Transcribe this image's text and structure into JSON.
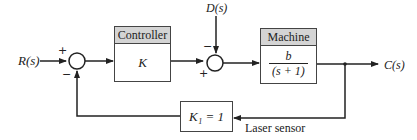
{
  "diagram": {
    "input_label": "R(s)",
    "disturbance_label": "D(s)",
    "output_label": "C(s)",
    "summing_junction_1": {
      "plus_sign": "+",
      "minus_sign": "−"
    },
    "summing_junction_2": {
      "plus_sign": "+",
      "minus_sign": "−"
    },
    "controller": {
      "title": "Controller",
      "gain": "K"
    },
    "machine": {
      "title": "Machine",
      "numerator": "b",
      "denominator": "(s + 1)"
    },
    "sensor": {
      "gain": "K₁ = 1",
      "label": "Laser sensor"
    }
  },
  "colors": {
    "line": "#222222",
    "header_fill": "#d4d4d4"
  }
}
